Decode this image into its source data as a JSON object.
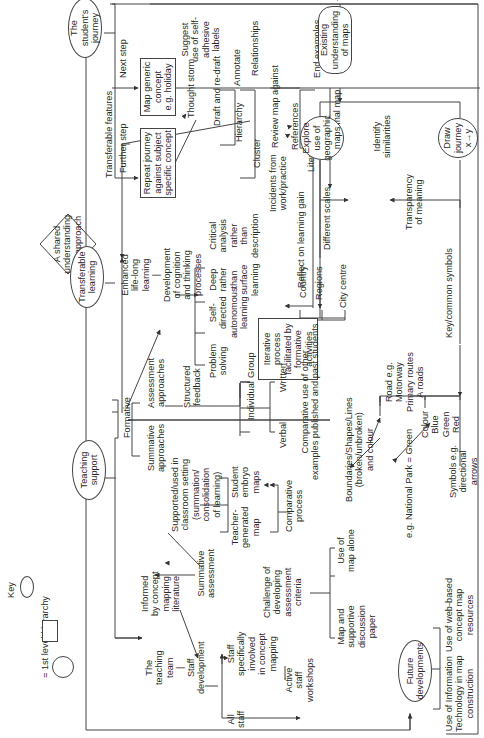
{
  "key": {
    "title": "Key",
    "items": [
      {
        "shape": "ellipse",
        "label": "= 1st level hierarchy"
      },
      {
        "shape": "rectangle",
        "label": "= 2nd level hierarchy"
      },
      {
        "shape": "circle",
        "label": "= 3rd level hierarchy"
      }
    ]
  },
  "center": {
    "label_lines": [
      "A shared",
      "understanding",
      "and approach"
    ]
  },
  "level1": {
    "students_journey": [
      "The",
      "student's",
      "journey"
    ],
    "transferable_learning": [
      "Transferable",
      "learning"
    ],
    "teaching_support": [
      "Teaching",
      "support"
    ],
    "future_developments": [
      "Future",
      "developments"
    ]
  },
  "journey": {
    "transferable_features": "Transferable features",
    "next_step": "Next step",
    "further_step": "Further step",
    "map_generic": [
      "Map generic",
      "concept",
      "e.g. holiday"
    ],
    "repeat_journey": [
      "Repeat journey",
      "against subject",
      "specific concept"
    ],
    "thought_storm": "Thought storm",
    "suggest_labels": [
      "Suggest",
      "use of self-",
      "adhesive",
      "labels"
    ],
    "draft": "Draft and re-draft",
    "annotate": "Annotate",
    "relationships": "Relationships",
    "hierarchy": "Hierarchy",
    "cluster": "Cluster",
    "incidents": [
      "Incidents from",
      "work/practice"
    ],
    "review_map": "Review map against",
    "end_examples": "End examples",
    "references": "References",
    "literature": "Literature",
    "final_map": "Final map",
    "existing_understanding": [
      "Existing",
      "understanding",
      "of maps"
    ],
    "explore_geo": [
      "Explore",
      "use of",
      "geographic",
      "maps"
    ],
    "identify_similarities": [
      "Identify",
      "similarities"
    ],
    "draw_journey": [
      "Draw",
      "journey",
      "x→y"
    ],
    "different_scales": "Different scales",
    "transparency": [
      "Transparency",
      "of meaning"
    ],
    "key_symbols": "Key/common symbols",
    "country": "Country",
    "regions": "Regions",
    "city_centre": "City centre",
    "road": [
      "Road e.g.",
      "Motorway",
      "Primary routes",
      "A roads"
    ],
    "colour": [
      "Colour",
      "Blue",
      "Green",
      "Red"
    ],
    "symbols": [
      "Symbols e.g.",
      "directional",
      "arrows"
    ],
    "boundaries": [
      "Boundaries/Shapes/Lines",
      "(broken/unbroken)",
      "and colour"
    ],
    "national_park": "e.g. National Park = Green"
  },
  "learning": {
    "enhanced": [
      "Enhanced",
      "life-long",
      "learning",
      "|",
      "Development",
      "of cognition",
      "and thinking",
      "processes"
    ],
    "problem_solving": [
      "Problem",
      "solving"
    ],
    "self_directed": [
      "Self-",
      "directed",
      "autonomous",
      "learning"
    ],
    "deep": [
      "Deep",
      "rather",
      "than",
      "surface",
      "learning"
    ],
    "critical": [
      "Critical",
      "analysis",
      "rather",
      "than",
      "description"
    ],
    "iterative": [
      "Iterative",
      "process",
      "facilitated by",
      "formative",
      "activities"
    ],
    "reflect": "Reflect on learning gain"
  },
  "teaching": {
    "formative": "Formative",
    "assessment_approaches": [
      "Assessment",
      "approaches"
    ],
    "summative_approaches": [
      "Summative",
      "approaches"
    ],
    "structured_feedback": [
      "Structured",
      "feedback"
    ],
    "individual": "Individual",
    "group": "Group",
    "verbal": "Verbal",
    "written": "Written",
    "comparative_use": [
      "Comparative use of other",
      "examples published and past students"
    ],
    "supported": [
      "Supported/used in",
      "classroom setting",
      "(summation/",
      "consolidation",
      "of learning)"
    ],
    "student_embryo": [
      "Student",
      "embryo",
      "maps"
    ],
    "teacher_generated": [
      "Teacher-",
      "generated",
      "map"
    ],
    "comparative_process": [
      "Comparative",
      "process"
    ],
    "informed": [
      "Informed",
      "by concept",
      "mapping",
      "literature"
    ],
    "summative_assessment": [
      "Summative",
      "assessment"
    ],
    "challenge": [
      "Challenge of",
      "developing",
      "assessment",
      "criteria"
    ],
    "use_map_alone": [
      "Use of",
      "map alone"
    ],
    "map_supportive": [
      "Map and",
      "supportive",
      "discussion",
      "paper"
    ],
    "teaching_team": [
      "The",
      "teaching",
      "team",
      "|",
      "Staff",
      "development"
    ],
    "staff_specific": [
      "Staff",
      "specifically",
      "involved",
      "in concept",
      "mapping"
    ],
    "all_staff": [
      "All",
      "staff"
    ],
    "active_workshops": [
      "Active",
      "staff",
      "workshops"
    ]
  },
  "future": {
    "web_based": [
      "Use of web-based",
      "concept map",
      "resources"
    ],
    "it": [
      "Use of Information",
      "Technology in map",
      "construction"
    ]
  }
}
